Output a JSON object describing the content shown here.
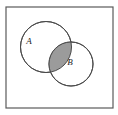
{
  "figure": {
    "type": "venn-diagram",
    "caption": "",
    "universe": {
      "name": "universal-set-rectangle",
      "label": "",
      "x": 6,
      "y": 7,
      "width": 107,
      "height": 101,
      "stroke_color": "#5a5a5a",
      "fill_color": "#ffffff",
      "stroke_width": 1.2
    },
    "sets": [
      {
        "id": "A",
        "label": "A",
        "name": "circle-set-a",
        "cx": 46,
        "cy": 47,
        "r": 25.5,
        "label_x": 29,
        "label_y": 42,
        "stroke_color": "#4a4a4a",
        "fill_color": "#ffffff",
        "stroke_width": 1.0
      },
      {
        "id": "B",
        "label": "B",
        "name": "circle-set-b",
        "cx": 71,
        "cy": 64,
        "r": 22.0,
        "label_x": 70,
        "label_y": 63,
        "stroke_color": "#4a4a4a",
        "fill_color": "#ffffff",
        "stroke_width": 1.0
      }
    ],
    "shaded_region": {
      "name": "intersection-a-and-b",
      "description": "A intersect B",
      "fill_color": "#9b9b9b",
      "stroke_color": "#4a4a4a"
    },
    "background_color": "#ffffff"
  }
}
